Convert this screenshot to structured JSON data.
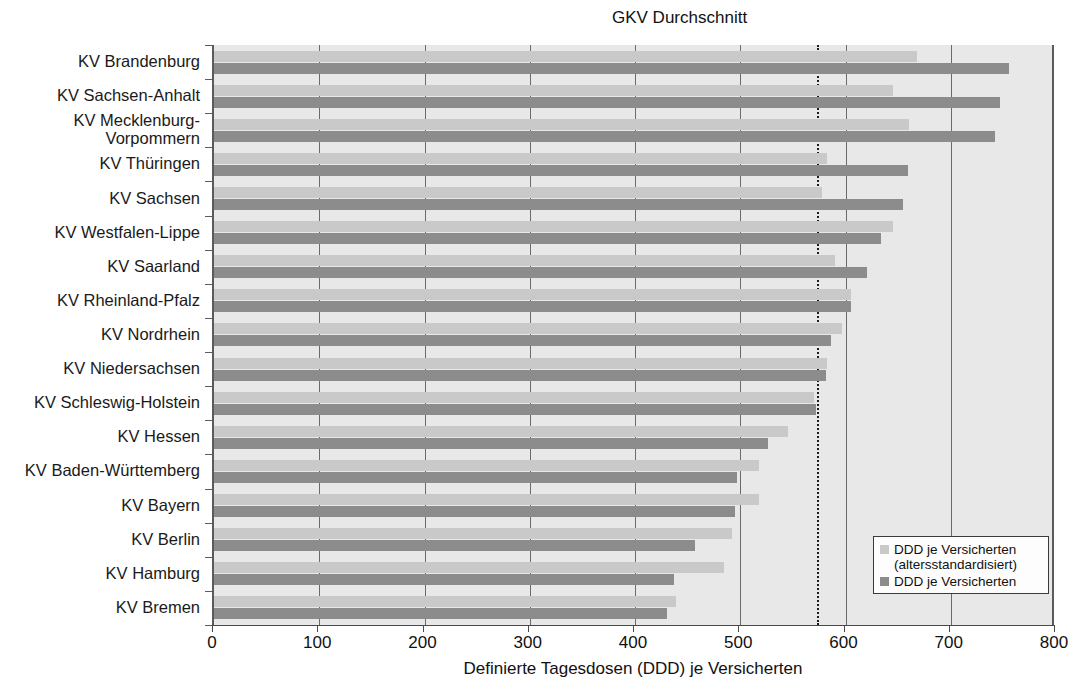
{
  "chart_data": {
    "type": "bar",
    "orientation": "horizontal",
    "title": "",
    "xlabel": "Definierte Tagesdosen (DDD) je Versicherten",
    "ylabel": "",
    "xlim": [
      0,
      800
    ],
    "xticks": [
      0,
      100,
      200,
      300,
      400,
      500,
      600,
      700,
      800
    ],
    "grid": true,
    "legend_position": "bottom-right",
    "categories": [
      "KV Brandenburg",
      "KV Sachsen-Anhalt",
      "KV Mecklenburg-\nVorpommern",
      "KV Thüringen",
      "KV Sachsen",
      "KV Westfalen-Lippe",
      "KV Saarland",
      "KV Rheinland-Pfalz",
      "KV Nordrhein",
      "KV Niedersachsen",
      "KV Schleswig-Holstein",
      "KV Hessen",
      "KV Baden-Württemberg",
      "KV Bayern",
      "KV Berlin",
      "KV Hamburg",
      "KV Bremen"
    ],
    "series": [
      {
        "name": "DDD je Versicherten (altersstandardisiert)",
        "color": "#c9c9c9",
        "values": [
          668,
          645,
          660,
          582,
          578,
          645,
          590,
          605,
          597,
          582,
          570,
          545,
          518,
          518,
          492,
          485,
          439
        ]
      },
      {
        "name": "DDD je Versicherten",
        "color": "#8c8c8c",
        "values": [
          755,
          747,
          742,
          659,
          655,
          634,
          620,
          605,
          586,
          581,
          572,
          526,
          497,
          495,
          457,
          437,
          430
        ]
      }
    ],
    "annotations": [
      {
        "label": "GKV Durchschnitt",
        "type": "vertical-line",
        "value": 573,
        "style": "dotted"
      }
    ]
  },
  "legend": {
    "entries": [
      {
        "label": "DDD je Versicherten\n(altersstandardisiert)",
        "swatch": "light"
      },
      {
        "label": "DDD je Versicherten",
        "swatch": "dark"
      }
    ]
  },
  "axis": {
    "x_title": "Definierte Tagesdosen (DDD) je Versicherten",
    "tick_labels": [
      "0",
      "100",
      "200",
      "300",
      "400",
      "500",
      "600",
      "700",
      "800"
    ]
  },
  "average_marker": {
    "label": "GKV Durchschnitt",
    "value": 573
  },
  "colors": {
    "light_bar": "#c9c9c9",
    "dark_bar": "#8c8c8c",
    "plot_background": "#e8e8e8",
    "gridline": "#6a6a6a",
    "axis": "#4a4a4a",
    "text": "#1a1a1a"
  }
}
